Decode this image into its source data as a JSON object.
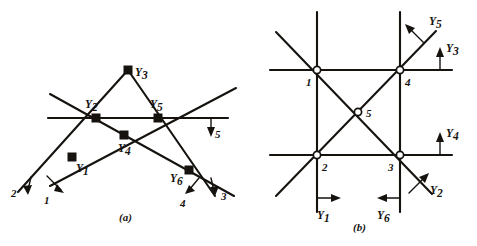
{
  "figure": {
    "panels": [
      {
        "id": "a",
        "caption": "(a)",
        "caption_pos": [
          128,
          218
        ],
        "description": "truss-with-six-members-and-applied-forces",
        "nodes": [
          {
            "name": "Y1",
            "base": "Y",
            "sub": "1",
            "x": 72,
            "y": 157,
            "label_x": 76,
            "label_y": 172,
            "marker": "solid"
          },
          {
            "name": "Y2",
            "base": "Y",
            "sub": "2",
            "x": 96,
            "y": 118,
            "label_x": 85,
            "label_y": 108,
            "marker": "solid"
          },
          {
            "name": "Y3",
            "base": "Y",
            "sub": "3",
            "x": 128,
            "y": 70,
            "label_x": 135,
            "label_y": 76,
            "marker": "solid"
          },
          {
            "name": "Y4",
            "base": "Y",
            "sub": "4",
            "x": 124,
            "y": 135,
            "label_x": 118,
            "label_y": 152,
            "marker": "solid"
          },
          {
            "name": "Y5",
            "base": "Y",
            "sub": "5",
            "x": 158,
            "y": 118,
            "label_x": 150,
            "label_y": 108,
            "marker": "solid"
          },
          {
            "name": "Y6",
            "base": "Y",
            "sub": "6",
            "x": 189,
            "y": 170,
            "label_x": 172,
            "label_y": 182,
            "marker": "solid"
          }
        ],
        "members": [
          {
            "name": "long-diagonal-left-up",
            "x1": 18,
            "y1": 192,
            "x2": 128,
            "y2": 70
          },
          {
            "name": "long-diagonal-right-down",
            "x1": 128,
            "y1": 70,
            "x2": 215,
            "y2": 196
          },
          {
            "name": "diagonal-lower-left-chord",
            "x1": 50,
            "y1": 94,
            "x2": 234,
            "y2": 196
          },
          {
            "name": "diagonal-upper-right-chord",
            "x1": 50,
            "y1": 186,
            "x2": 236,
            "y2": 88
          },
          {
            "name": "horizontal-chord",
            "x1": 48,
            "y1": 118,
            "x2": 228,
            "y2": 118
          }
        ],
        "force_arrows": [
          {
            "label": "1",
            "tail_x": 47,
            "tail_y": 176,
            "head_x": 62,
            "head_y": 192,
            "label_x": 47,
            "label_y": 202
          },
          {
            "label": "2",
            "tail_x": 31,
            "tail_y": 177,
            "head_x": 28,
            "head_y": 193,
            "label_x": 13,
            "label_y": 196
          },
          {
            "label": "3",
            "tail_x": 212,
            "tail_y": 178,
            "head_x": 214,
            "head_y": 195,
            "label_x": 222,
            "label_y": 200
          },
          {
            "label": "4",
            "tail_x": 199,
            "tail_y": 178,
            "head_x": 186,
            "head_y": 193,
            "label_x": 182,
            "label_y": 206
          },
          {
            "label": "5",
            "tail_x": 211,
            "tail_y": 118,
            "head_x": 211,
            "head_y": 136,
            "label_x": 216,
            "label_y": 137
          }
        ]
      },
      {
        "id": "b",
        "caption": "(b)",
        "caption_pos": [
          361,
          228
        ],
        "description": "grid-frame-with-five-joints-and-reaction-forces",
        "nodes": [
          {
            "name": "joint-1",
            "label": "1",
            "x": 317,
            "y": 70,
            "label_x": 307,
            "label_y": 86,
            "marker": "open"
          },
          {
            "name": "joint-2",
            "label": "2",
            "x": 317,
            "y": 155,
            "label_x": 322,
            "label_y": 170,
            "marker": "open"
          },
          {
            "name": "joint-3",
            "label": "3",
            "x": 400,
            "y": 155,
            "label_x": 389,
            "label_y": 170,
            "marker": "open"
          },
          {
            "name": "joint-4",
            "label": "4",
            "x": 400,
            "y": 70,
            "label_x": 405,
            "label_y": 86,
            "marker": "open"
          },
          {
            "name": "joint-5",
            "label": "5",
            "x": 358,
            "y": 112,
            "label_x": 366,
            "label_y": 117,
            "marker": "open"
          }
        ],
        "members": [
          {
            "name": "horizontal-upper",
            "x1": 270,
            "y1": 70,
            "x2": 452,
            "y2": 70
          },
          {
            "name": "horizontal-lower",
            "x1": 270,
            "y1": 155,
            "x2": 452,
            "y2": 155
          },
          {
            "name": "vertical-left",
            "x1": 317,
            "y1": 12,
            "x2": 317,
            "y2": 212
          },
          {
            "name": "vertical-right",
            "x1": 400,
            "y1": 12,
            "x2": 400,
            "y2": 212
          },
          {
            "name": "diagonal-nw-se",
            "x1": 276,
            "y1": 32,
            "x2": 432,
            "y2": 194
          },
          {
            "name": "diagonal-sw-ne",
            "x1": 276,
            "y1": 196,
            "x2": 436,
            "y2": 31
          }
        ],
        "force_arrows": [
          {
            "name": "Y1",
            "base": "Y",
            "sub": "1",
            "kind": "horizontal-right",
            "tail_x": 317,
            "tail_y": 198,
            "head_x": 340,
            "head_y": 198,
            "tick_x1": 317,
            "tick_y1": 185,
            "tick_y2": 212,
            "label_x": 321,
            "label_y": 218
          },
          {
            "name": "Y2",
            "base": "Y",
            "sub": "2",
            "kind": "diagonal-up-right",
            "tail_x": 410,
            "tail_y": 192,
            "head_x": 428,
            "head_y": 174,
            "label_x": 432,
            "label_y": 193
          },
          {
            "name": "Y3",
            "base": "Y",
            "sub": "3",
            "kind": "vertical-up",
            "tail_x": 440,
            "tail_y": 70,
            "head_x": 440,
            "head_y": 48,
            "label_x": 446,
            "label_y": 50
          },
          {
            "name": "Y4",
            "base": "Y",
            "sub": "4",
            "kind": "vertical-up",
            "tail_x": 440,
            "tail_y": 155,
            "head_x": 440,
            "head_y": 133,
            "label_x": 446,
            "label_y": 135
          },
          {
            "name": "Y5",
            "base": "Y",
            "sub": "5",
            "kind": "diagonal-up-left",
            "tail_x": 424,
            "tail_y": 42,
            "head_x": 406,
            "head_y": 24,
            "label_x": 430,
            "label_y": 22
          },
          {
            "name": "Y6",
            "base": "Y",
            "sub": "6",
            "kind": "horizontal-left",
            "tail_x": 400,
            "tail_y": 198,
            "head_x": 378,
            "head_y": 198,
            "tick_x1": 400,
            "tick_y1": 185,
            "tick_y2": 212,
            "label_x": 378,
            "label_y": 218
          }
        ]
      }
    ]
  },
  "colors": {
    "ink": "#16130f",
    "background": "#ffffff"
  }
}
